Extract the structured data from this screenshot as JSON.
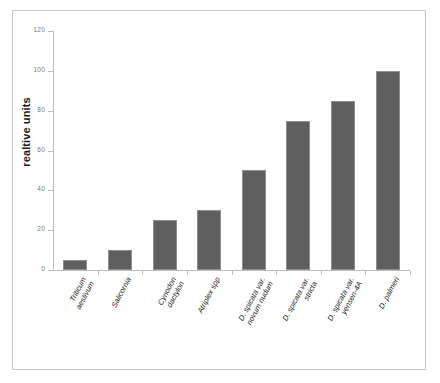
{
  "chart_data": {
    "type": "bar",
    "title": "",
    "xlabel": "",
    "ylabel": "realtive units",
    "ylim": [
      0,
      120
    ],
    "yticks": [
      0,
      20,
      40,
      60,
      80,
      100,
      120
    ],
    "ytick_labels": [
      "0",
      "20",
      "40",
      "60",
      "80",
      "100",
      "120"
    ],
    "grid": false,
    "legend": false,
    "bar_color": "#5f5f5f",
    "bar_edge_color": "#8f8f8f",
    "axis_color": "#bdbdbd",
    "frame_color": "#c8c8c8",
    "background": "#ffffff",
    "categories": [
      "Triticum\naestivum",
      "Salicornia",
      "Cynodon\ndactylon",
      "Atriplex spp",
      "D. spicata var.\nnovum nudum",
      "D. spicata var.\nstricta",
      "D. spicata var.\nyensen-4A",
      "D. palmeri"
    ],
    "values": [
      5,
      10,
      25,
      30,
      50,
      75,
      85,
      100
    ]
  }
}
